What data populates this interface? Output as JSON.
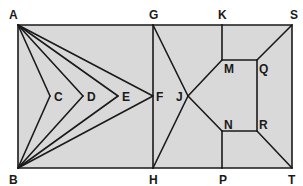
{
  "diagram": {
    "fill_color": "#d9d9d9",
    "line_color": "#1a1a1a",
    "points": [
      {
        "id": "A",
        "label": "A"
      },
      {
        "id": "B",
        "label": "B"
      },
      {
        "id": "C",
        "label": "C"
      },
      {
        "id": "D",
        "label": "D"
      },
      {
        "id": "E",
        "label": "E"
      },
      {
        "id": "F",
        "label": "F"
      },
      {
        "id": "G",
        "label": "G"
      },
      {
        "id": "H",
        "label": "H"
      },
      {
        "id": "J",
        "label": "J"
      },
      {
        "id": "K",
        "label": "K"
      },
      {
        "id": "M",
        "label": "M"
      },
      {
        "id": "N",
        "label": "N"
      },
      {
        "id": "P",
        "label": "P"
      },
      {
        "id": "Q",
        "label": "Q"
      },
      {
        "id": "R",
        "label": "R"
      },
      {
        "id": "S",
        "label": "S"
      },
      {
        "id": "T",
        "label": "T"
      }
    ],
    "segments": [
      [
        "A",
        "G"
      ],
      [
        "G",
        "K"
      ],
      [
        "K",
        "S"
      ],
      [
        "S",
        "T"
      ],
      [
        "T",
        "P"
      ],
      [
        "P",
        "H"
      ],
      [
        "H",
        "B"
      ],
      [
        "B",
        "A"
      ],
      [
        "G",
        "H"
      ],
      [
        "A",
        "C"
      ],
      [
        "C",
        "B"
      ],
      [
        "A",
        "D"
      ],
      [
        "D",
        "B"
      ],
      [
        "A",
        "E"
      ],
      [
        "E",
        "B"
      ],
      [
        "A",
        "F"
      ],
      [
        "F",
        "B"
      ],
      [
        "G",
        "J"
      ],
      [
        "J",
        "H"
      ],
      [
        "J",
        "M"
      ],
      [
        "J",
        "N"
      ],
      [
        "K",
        "M"
      ],
      [
        "M",
        "Q"
      ],
      [
        "Q",
        "S"
      ],
      [
        "Q",
        "R"
      ],
      [
        "N",
        "R"
      ],
      [
        "N",
        "P"
      ],
      [
        "R",
        "T"
      ]
    ]
  }
}
